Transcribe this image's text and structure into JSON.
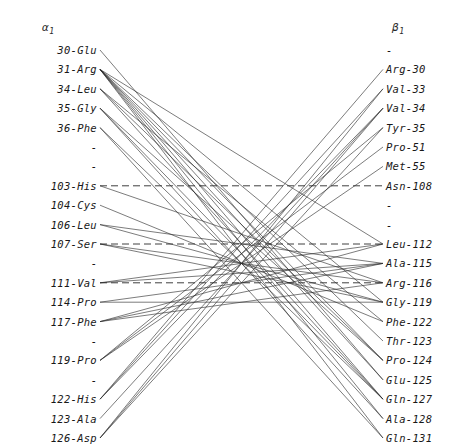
{
  "figure": {
    "left_header": "α",
    "left_header_sub": "1",
    "right_header": "β",
    "right_header_sub": "1",
    "blank_label": "-"
  },
  "left_column": {
    "name": "alpha1",
    "items": [
      {
        "label": "30-Glu",
        "residue": 30,
        "code": "Glu",
        "blank": false
      },
      {
        "label": "31-Arg",
        "residue": 31,
        "code": "Arg",
        "blank": false
      },
      {
        "label": "34-Leu",
        "residue": 34,
        "code": "Leu",
        "blank": false
      },
      {
        "label": "35-Gly",
        "residue": 35,
        "code": "Gly",
        "blank": false
      },
      {
        "label": "36-Phe",
        "residue": 36,
        "code": "Phe",
        "blank": false
      },
      {
        "label": "-",
        "residue": null,
        "code": "",
        "blank": true
      },
      {
        "label": "-",
        "residue": null,
        "code": "",
        "blank": true
      },
      {
        "label": "103-His",
        "residue": 103,
        "code": "His",
        "blank": false
      },
      {
        "label": "104-Cys",
        "residue": 104,
        "code": "Cys",
        "blank": false
      },
      {
        "label": "106-Leu",
        "residue": 106,
        "code": "Leu",
        "blank": false
      },
      {
        "label": "107-Ser",
        "residue": 107,
        "code": "Ser",
        "blank": false
      },
      {
        "label": "-",
        "residue": null,
        "code": "",
        "blank": true
      },
      {
        "label": "111-Val",
        "residue": 111,
        "code": "Val",
        "blank": false
      },
      {
        "label": "114-Pro",
        "residue": 114,
        "code": "Pro",
        "blank": false
      },
      {
        "label": "117-Phe",
        "residue": 117,
        "code": "Phe",
        "blank": false
      },
      {
        "label": "-",
        "residue": null,
        "code": "",
        "blank": true
      },
      {
        "label": "119-Pro",
        "residue": 119,
        "code": "Pro",
        "blank": false
      },
      {
        "label": "-",
        "residue": null,
        "code": "",
        "blank": true
      },
      {
        "label": "122-His",
        "residue": 122,
        "code": "His",
        "blank": false
      },
      {
        "label": "123-Ala",
        "residue": 123,
        "code": "Ala",
        "blank": false
      },
      {
        "label": "126-Asp",
        "residue": 126,
        "code": "Asp",
        "blank": false
      }
    ]
  },
  "right_column": {
    "name": "beta1",
    "items": [
      {
        "label": "-",
        "residue": null,
        "code": "",
        "blank": true
      },
      {
        "label": "Arg-30",
        "residue": 30,
        "code": "Arg",
        "blank": false
      },
      {
        "label": "Val-33",
        "residue": 33,
        "code": "Val",
        "blank": false
      },
      {
        "label": "Val-34",
        "residue": 34,
        "code": "Val",
        "blank": false
      },
      {
        "label": "Tyr-35",
        "residue": 35,
        "code": "Tyr",
        "blank": false
      },
      {
        "label": "Pro-51",
        "residue": 51,
        "code": "Pro",
        "blank": false
      },
      {
        "label": "Met-55",
        "residue": 55,
        "code": "Met",
        "blank": false
      },
      {
        "label": "Asn-108",
        "residue": 108,
        "code": "Asn",
        "blank": false
      },
      {
        "label": "-",
        "residue": null,
        "code": "",
        "blank": true
      },
      {
        "label": "-",
        "residue": null,
        "code": "",
        "blank": true
      },
      {
        "label": "Leu-112",
        "residue": 112,
        "code": "Leu",
        "blank": false
      },
      {
        "label": "Ala-115",
        "residue": 115,
        "code": "Ala",
        "blank": false
      },
      {
        "label": "Arg-116",
        "residue": 116,
        "code": "Arg",
        "blank": false
      },
      {
        "label": "Gly-119",
        "residue": 119,
        "code": "Gly",
        "blank": false
      },
      {
        "label": "Phe-122",
        "residue": 122,
        "code": "Phe",
        "blank": false
      },
      {
        "label": "Thr-123",
        "residue": 123,
        "code": "Thr",
        "blank": false
      },
      {
        "label": "Pro-124",
        "residue": 124,
        "code": "Pro",
        "blank": false
      },
      {
        "label": "Glu-125",
        "residue": 125,
        "code": "Glu",
        "blank": false
      },
      {
        "label": "Gln-127",
        "residue": 127,
        "code": "Gln",
        "blank": false
      },
      {
        "label": "Ala-128",
        "residue": 128,
        "code": "Ala",
        "blank": false
      },
      {
        "label": "Gln-131",
        "residue": 131,
        "code": "Gln",
        "blank": false
      }
    ]
  },
  "layout": {
    "row0_y": 50,
    "row_step": 19.4,
    "left_label_right_edge": 97,
    "right_label_left_edge": 386,
    "line_x_start": 100,
    "line_x_end": 383,
    "line_color": "#2a2a2a"
  },
  "edges": [
    {
      "left": 0,
      "right": 17,
      "style": "solid"
    },
    {
      "left": 1,
      "right": 10,
      "style": "solid"
    },
    {
      "left": 1,
      "right": 13,
      "style": "solid"
    },
    {
      "left": 1,
      "right": 15,
      "style": "solid"
    },
    {
      "left": 1,
      "right": 16,
      "style": "solid"
    },
    {
      "left": 1,
      "right": 17,
      "style": "solid"
    },
    {
      "left": 1,
      "right": 18,
      "style": "solid"
    },
    {
      "left": 1,
      "right": 19,
      "style": "solid"
    },
    {
      "left": 1,
      "right": 20,
      "style": "solid"
    },
    {
      "left": 2,
      "right": 14,
      "style": "solid"
    },
    {
      "left": 2,
      "right": 16,
      "style": "solid"
    },
    {
      "left": 2,
      "right": 18,
      "style": "solid"
    },
    {
      "left": 3,
      "right": 16,
      "style": "solid"
    },
    {
      "left": 3,
      "right": 18,
      "style": "solid"
    },
    {
      "left": 3,
      "right": 19,
      "style": "solid"
    },
    {
      "left": 4,
      "right": 18,
      "style": "solid"
    },
    {
      "left": 4,
      "right": 20,
      "style": "solid"
    },
    {
      "left": 7,
      "right": 7,
      "style": "dashed"
    },
    {
      "left": 7,
      "right": 12,
      "style": "solid"
    },
    {
      "left": 8,
      "right": 14,
      "style": "solid"
    },
    {
      "left": 9,
      "right": 11,
      "style": "solid"
    },
    {
      "left": 9,
      "right": 13,
      "style": "solid"
    },
    {
      "left": 10,
      "right": 10,
      "style": "dashed"
    },
    {
      "left": 10,
      "right": 12,
      "style": "solid"
    },
    {
      "left": 10,
      "right": 13,
      "style": "solid"
    },
    {
      "left": 12,
      "right": 12,
      "style": "dashed"
    },
    {
      "left": 12,
      "right": 10,
      "style": "solid"
    },
    {
      "left": 12,
      "right": 11,
      "style": "solid"
    },
    {
      "left": 13,
      "right": 11,
      "style": "solid"
    },
    {
      "left": 13,
      "right": 13,
      "style": "solid"
    },
    {
      "left": 14,
      "right": 10,
      "style": "solid"
    },
    {
      "left": 14,
      "right": 11,
      "style": "solid"
    },
    {
      "left": 14,
      "right": 12,
      "style": "solid"
    },
    {
      "left": 16,
      "right": 4,
      "style": "solid"
    },
    {
      "left": 16,
      "right": 5,
      "style": "solid"
    },
    {
      "left": 16,
      "right": 6,
      "style": "solid"
    },
    {
      "left": 18,
      "right": 1,
      "style": "solid"
    },
    {
      "left": 18,
      "right": 2,
      "style": "solid"
    },
    {
      "left": 18,
      "right": 3,
      "style": "solid"
    },
    {
      "left": 19,
      "right": 3,
      "style": "solid"
    },
    {
      "left": 20,
      "right": 2,
      "style": "solid"
    },
    {
      "left": 20,
      "right": 3,
      "style": "solid"
    },
    {
      "left": 20,
      "right": 4,
      "style": "solid"
    }
  ]
}
